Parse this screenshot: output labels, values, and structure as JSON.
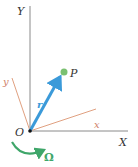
{
  "diagram": {
    "labels": {
      "fixed_y_axis": "Y",
      "fixed_x_axis": "X",
      "body_y_axis": "y",
      "body_x_axis": "x",
      "origin": "O",
      "position_vector": "r",
      "point": "P",
      "angular_velocity": "Ω"
    },
    "colors": {
      "fixed_axes": "#7a7a7a",
      "body_axes": "#e0a080",
      "body_axis_labels": "#d0806a",
      "vector": "#3b9ad9",
      "point": "#7ac070",
      "rotation_arrow": "#3fa66a",
      "text": "#333333"
    }
  }
}
